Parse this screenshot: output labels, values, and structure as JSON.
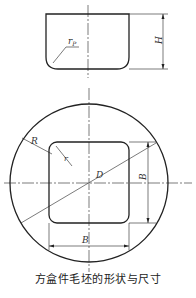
{
  "figure": {
    "caption": "方盒件毛坯的形状与尺寸",
    "top_view": {
      "labels": {
        "corner_radius": "r",
        "corner_radius_sub": "P",
        "height": "H"
      }
    },
    "plan_view": {
      "labels": {
        "blank_radius": "R",
        "corner_radius": "r",
        "diameter": "D",
        "side_vertical": "B",
        "side_horizontal": "B"
      }
    }
  }
}
